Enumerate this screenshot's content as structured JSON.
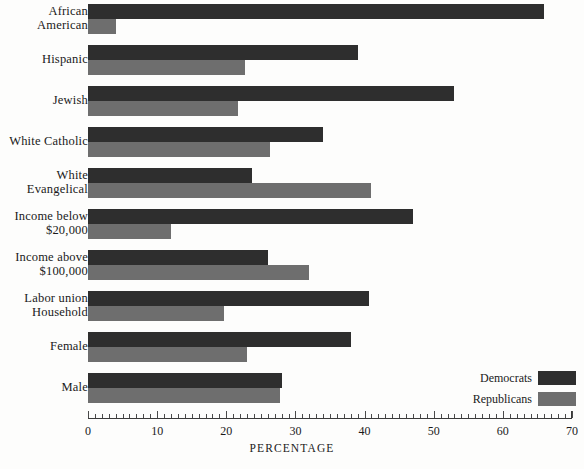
{
  "chart_data": {
    "type": "bar",
    "orientation": "horizontal",
    "title": "",
    "xlabel": "PERCENTAGE",
    "ylabel": "",
    "xlim": [
      0,
      70
    ],
    "grid": false,
    "legend_position": "bottom-right",
    "major_tick_step": 10,
    "minor_tick_step": 1,
    "tick_labels": [
      "0",
      "10",
      "20",
      "30",
      "40",
      "50",
      "60",
      "70"
    ],
    "tick_values": [
      0,
      10,
      20,
      30,
      40,
      50,
      60,
      70
    ],
    "categories": [
      "African\nAmerican",
      "Hispanic",
      "Jewish",
      "White Catholic",
      "White\nEvangelical",
      "Income below\n$20,000",
      "Income above\n$100,000",
      "Labor union\nHousehold",
      "Female",
      "Male"
    ],
    "series": [
      {
        "name": "Democrats",
        "color": "#2e2e2e",
        "values": [
          66,
          39,
          53,
          34,
          23.7,
          47,
          26,
          40.7,
          38,
          28
        ]
      },
      {
        "name": "Republicans",
        "color": "#6e6e6e",
        "values": [
          4,
          22.7,
          21.7,
          26.3,
          41,
          12,
          32,
          19.7,
          23,
          27.8
        ]
      }
    ]
  },
  "legend": {
    "items": [
      {
        "label": "Democrats",
        "color": "#2e2e2e"
      },
      {
        "label": "Republicans",
        "color": "#6e6e6e"
      }
    ]
  },
  "axis": {
    "title": "PERCENTAGE"
  },
  "caption_fragment": ""
}
